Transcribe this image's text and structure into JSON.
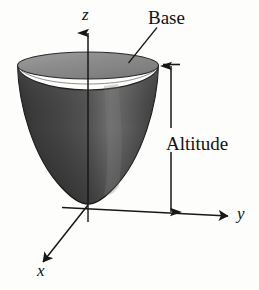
{
  "figure": {
    "kind": "3d-solid-diagram",
    "background_color": "#fdfdfb",
    "ink_color": "#121212"
  },
  "axes": {
    "z": {
      "label": "z",
      "direction": "up"
    },
    "y": {
      "label": "y",
      "direction": "right"
    },
    "x": {
      "label": "x",
      "direction": "down-left"
    },
    "origin_label": ""
  },
  "callouts": {
    "base": {
      "label": "Base",
      "leader": "line from label down-left to top elliptical face"
    },
    "altitude": {
      "label": "Altitude",
      "marker": "double-headed vertical dimension arrow at right of solid"
    }
  },
  "solid": {
    "name": "paraboloid",
    "surface_dark_color": "#3a3a3a",
    "surface_mid_color": "#585858",
    "surface_highlight_color": "#6f6f6f",
    "top_face_color": "#8e8e8e",
    "top_face_rim_color": "#9b9b9b",
    "outline_color": "#1d1d1d"
  }
}
